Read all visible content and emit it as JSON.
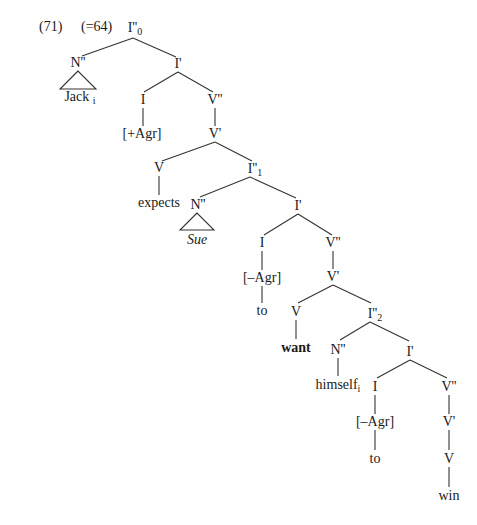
{
  "example": {
    "number": "(71)",
    "reference": "(=64)"
  },
  "tree": {
    "root": {
      "label": "I''",
      "sub": "0"
    },
    "n_jack": {
      "label": "N''",
      "leaf": "Jack",
      "leaf_sub": "i"
    },
    "i_bar_top": {
      "label": "I'"
    },
    "i_top": {
      "label": "I",
      "feature": "[+Agr]"
    },
    "v2_top": {
      "label": "V''"
    },
    "v1_top": {
      "label": "V'"
    },
    "v_expects": {
      "label": "V",
      "word": "expects"
    },
    "ip1": {
      "label": "I''",
      "sub": "1"
    },
    "n_sue": {
      "label": "N''",
      "leaf": "Sue"
    },
    "i_bar_1": {
      "label": "I'"
    },
    "i_1": {
      "label": "I",
      "feature": "[–Agr]",
      "word": "to"
    },
    "v2_1": {
      "label": "V''"
    },
    "v1_1": {
      "label": "V'"
    },
    "v_want": {
      "label": "V",
      "word": "want"
    },
    "ip2": {
      "label": "I''",
      "sub": "2"
    },
    "n_himself": {
      "label": "N''",
      "word": "himself",
      "word_sub": "i"
    },
    "i_bar_2": {
      "label": "I'"
    },
    "i_2": {
      "label": "I",
      "feature": "[–Agr]",
      "word": "to"
    },
    "v2_2": {
      "label": "V''"
    },
    "v1_2": {
      "label": "V'"
    },
    "v_win": {
      "label": "V",
      "word": "win"
    }
  }
}
